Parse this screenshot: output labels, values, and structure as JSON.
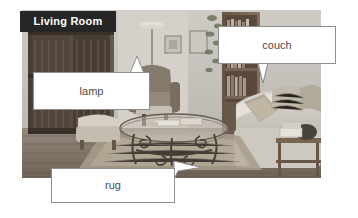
{
  "background_color": "#ffffff",
  "photo": {
    "alt_name": "living-room-photograph",
    "description": "Grayscale photograph of a living room interior",
    "scene_elements": [
      "wooden shuttered window on left wall",
      "hanging pendant lamp",
      "framed pictures on wall",
      "tall wooden bookshelf with books",
      "upholstered armchair",
      "glass coffee table with wrought iron scroll legs",
      "light colored couch with patterned cushions",
      "side table with objects",
      "patterned area rug on wood floor"
    ]
  },
  "banner": {
    "label": "Living Room",
    "background_color": "#262626",
    "text_color": "#ffffff"
  },
  "callouts": [
    {
      "id": "couch",
      "label": "couch",
      "tail_direction": "down",
      "border_color": "#8e8e8e",
      "fill_color": "#ffffff",
      "text_color": "#4a4a4a"
    },
    {
      "id": "lamp",
      "label": "lamp",
      "tail_direction": "up",
      "border_color": "#8e8e8e",
      "fill_color": "#ffffff",
      "text_color": "#4a4a4a"
    },
    {
      "id": "rug",
      "label": "rug",
      "tail_direction": "up-right",
      "border_color": "#8e8e8e",
      "fill_color": "#ffffff",
      "text_color": "#4a4a4a"
    }
  ]
}
